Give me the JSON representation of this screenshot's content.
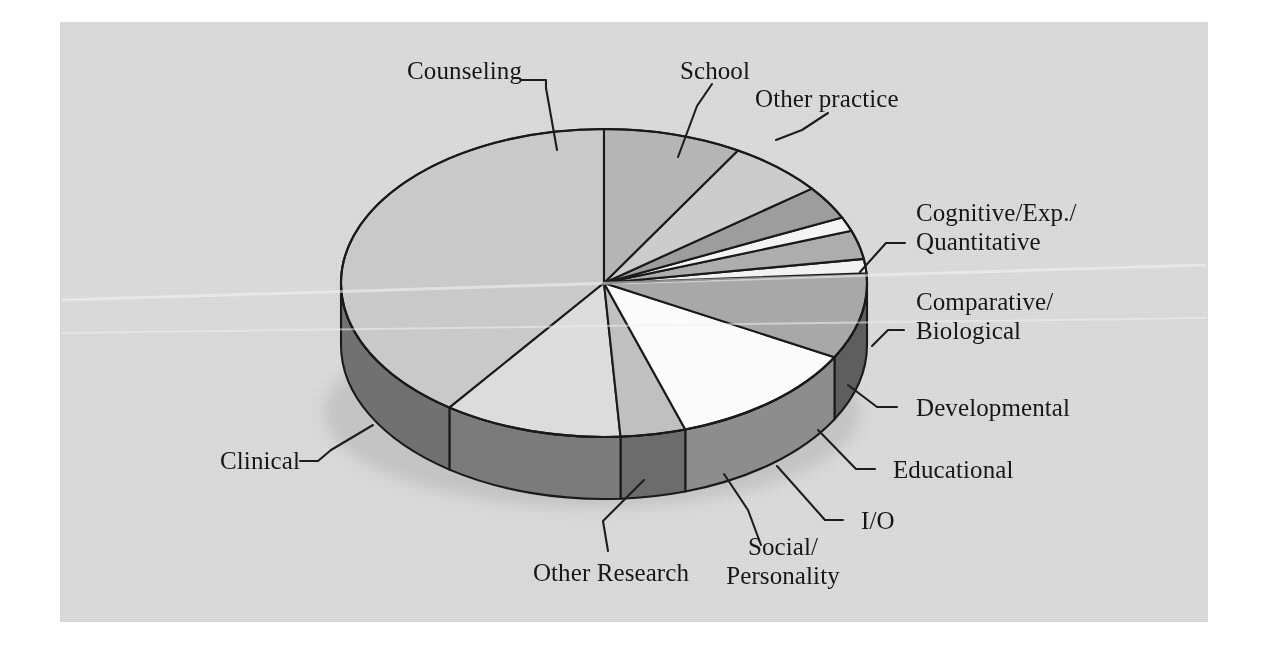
{
  "figure": {
    "kind": "3d-pie-chart",
    "background_color": "#dedede",
    "outline_color": "#1a1a1a"
  },
  "chart_data": {
    "type": "pie",
    "title": "",
    "subtitle": "",
    "xlabel": "",
    "ylabel": "",
    "grid": false,
    "legend_position": "callout-labels",
    "three_d": true,
    "start_angle_deg": -90,
    "direction": "counterclockwise",
    "categories": [
      "Clinical",
      "Counseling",
      "School",
      "Other practice",
      "Cognitive/Exp./\nQuantitative",
      "Comparative/\nBiological",
      "Developmental",
      "Educational",
      "I/O",
      "Social/\nPersonality",
      "Other Research"
    ],
    "labels": [
      "Clinical",
      "Counseling",
      "School",
      "Other practice",
      "Cognitive/Exp./Quantitative",
      "Comparative/Biological",
      "Developmental",
      "Educational",
      "I/O",
      "Social/Personality",
      "Other Research"
    ],
    "values": [
      40.0,
      11.0,
      4.0,
      12.0,
      9.0,
      1.5,
      3.0,
      1.5,
      3.5,
      6.0,
      8.5
    ],
    "units": "percent",
    "slice_colors": [
      "#c9c9c9",
      "#dcdcdc",
      "#c0c0c0",
      "#fbfbfb",
      "#a8a8a8",
      "#f2f2f2",
      "#adadad",
      "#f4f4f4",
      "#9d9d9d",
      "#cccccc",
      "#b5b5b5"
    ],
    "side_wall_color": "#6e6e6e",
    "shadow_color": "#c2c2c2"
  },
  "labels": {
    "counseling": "Counseling",
    "school": "School",
    "other_practice": "Other practice",
    "cognitive_line1": "Cognitive/Exp./",
    "cognitive_line2": "Quantitative",
    "comparative_line1": "Comparative/",
    "comparative_line2": "Biological",
    "developmental": "Developmental",
    "educational": "Educational",
    "io": "I/O",
    "social_line1": "Social/",
    "social_line2": "Personality",
    "other_research": "Other Research",
    "clinical": "Clinical"
  }
}
